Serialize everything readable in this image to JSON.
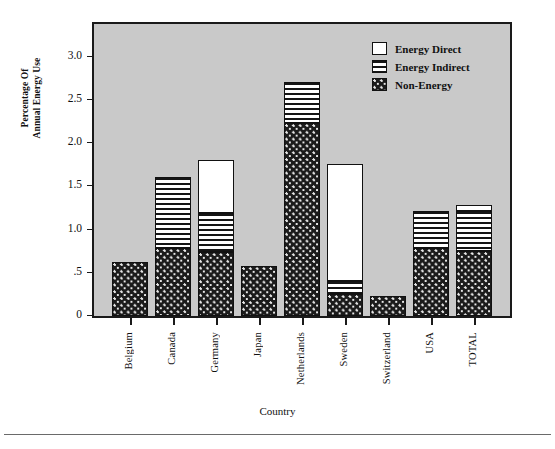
{
  "chart_data": {
    "type": "bar",
    "stacked": true,
    "title": "",
    "xlabel": "Country",
    "ylabel": "Percentage Of Annual Energy Use",
    "ylabel_line1": "Percentage Of",
    "ylabel_line2": "Annual Energy Use",
    "categories": [
      "Belgium",
      "Canada",
      "Germany",
      "Japan",
      "Netherlands",
      "Sweden",
      "Switzerland",
      "USA",
      "TOTAL"
    ],
    "series": [
      {
        "name": "Non-Energy",
        "pattern": "dotted-dark",
        "color": "#1b1b1b",
        "values": [
          0.62,
          0.79,
          0.74,
          0.58,
          2.23,
          0.26,
          0.23,
          0.79,
          0.75
        ]
      },
      {
        "name": "Energy Indirect",
        "pattern": "horizontal-stripes",
        "color": "#ffffff",
        "values": [
          0.0,
          0.82,
          0.45,
          0.0,
          0.48,
          0.14,
          0.0,
          0.42,
          0.47
        ]
      },
      {
        "name": "Energy Direct",
        "pattern": "solid-white",
        "color": "#ffffff",
        "values": [
          0.0,
          0.0,
          0.62,
          0.0,
          0.0,
          1.36,
          0.0,
          0.0,
          0.07
        ]
      }
    ],
    "totals": [
      0.62,
      1.61,
      1.81,
      0.58,
      2.71,
      1.76,
      0.23,
      1.21,
      1.29
    ],
    "ylim": [
      0,
      3.38
    ],
    "yticks": [
      0,
      0.5,
      1.0,
      1.5,
      2.0,
      2.5,
      3.0
    ],
    "ytick_labels": [
      "0",
      ".5",
      "1.0",
      "1.5",
      "2.0",
      "2.5",
      "3.0"
    ],
    "grid": false,
    "legend_position": "top-right",
    "plot_background": "#c9c9c9"
  },
  "legend": {
    "items": [
      {
        "label": "Energy Direct",
        "swatch": "solid-white"
      },
      {
        "label": "Energy Indirect",
        "swatch": "horizontal-stripes"
      },
      {
        "label": "Non-Energy",
        "swatch": "dotted-dark"
      }
    ]
  }
}
